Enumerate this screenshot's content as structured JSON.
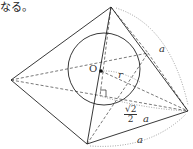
{
  "caption": "なる。",
  "diagram": {
    "type": "square pyramid with inscribed sphere",
    "vertices": {
      "apex": [
        111,
        7
      ],
      "left": [
        11,
        80
      ],
      "bottom": [
        87,
        144
      ],
      "right": [
        188,
        111
      ],
      "back": [
        148,
        53
      ]
    },
    "sphere": {
      "center": [
        104,
        69
      ],
      "radius": 36
    },
    "labels": {
      "center": "O",
      "radius": "r",
      "edge_top": "a",
      "edge_bottom": "a",
      "half_diag_num": "√2",
      "half_diag_den": "2",
      "half_diag_var": "a"
    },
    "colors": {
      "line": "#222222",
      "dashed": "#555555",
      "dotted": "#888888"
    }
  }
}
